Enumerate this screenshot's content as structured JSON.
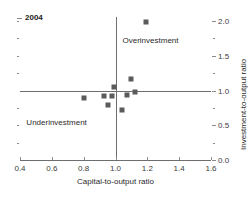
{
  "chart_data": {
    "type": "scatter",
    "title": "",
    "xlabel": "Capital-to-output ratio",
    "ylabel": "Investment-to-output ratio",
    "xlim": [
      0.4,
      1.6
    ],
    "ylim": [
      0.0,
      2.0
    ],
    "xticks": [
      "0.4",
      "0.6",
      "0.8",
      "1.0",
      "1.2",
      "1.4",
      "1.6"
    ],
    "xtick_values": [
      0.4,
      0.6,
      0.8,
      1.0,
      1.2,
      1.4,
      1.6
    ],
    "yticks": [
      "0.0",
      "0.5",
      "1.0",
      "1.5",
      "2.0"
    ],
    "ytick_values": [
      0.0,
      0.5,
      1.0,
      1.5,
      2.0
    ],
    "y_axis_position": "right",
    "grid": false,
    "legend": "none",
    "reference_lines": {
      "vertical_x": 1.0,
      "horizontal_y": 1.0
    },
    "annotations": [
      {
        "text": "Overinvestment",
        "x": 1.22,
        "y": 1.72
      },
      {
        "text": "Underinvestment",
        "x": 0.63,
        "y": 0.55
      }
    ],
    "series": [
      {
        "name": "2004",
        "marker": "square",
        "color": "#5b5b5b",
        "points": [
          {
            "x": 1.19,
            "y": 1.99
          },
          {
            "x": 1.1,
            "y": 1.16
          },
          {
            "x": 0.99,
            "y": 1.05
          },
          {
            "x": 1.12,
            "y": 0.98
          },
          {
            "x": 1.07,
            "y": 0.94
          },
          {
            "x": 0.98,
            "y": 0.92
          },
          {
            "x": 0.93,
            "y": 0.92
          },
          {
            "x": 0.8,
            "y": 0.89
          },
          {
            "x": 0.95,
            "y": 0.79
          },
          {
            "x": 1.04,
            "y": 0.72
          }
        ]
      }
    ]
  },
  "legend": {
    "year_label": "2004"
  },
  "colors": {
    "marker": "#5b5b5b",
    "axis": "#6e6e6e",
    "tick": "#8a8a8a",
    "text": "#2b2b2b",
    "background": "#ffffff"
  }
}
